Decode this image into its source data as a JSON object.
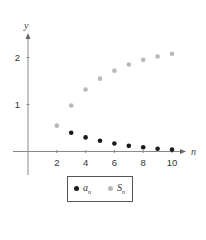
{
  "chart_data": {
    "type": "scatter",
    "title": "",
    "xlabel": "n",
    "ylabel": "y",
    "x_ticks": [
      2,
      4,
      6,
      8,
      10
    ],
    "y_ticks": [
      1,
      2
    ],
    "xlim": [
      -0.5,
      11
    ],
    "ylim": [
      -0.5,
      2.5
    ],
    "grid": false,
    "legend_position": "bottom-center",
    "series": [
      {
        "name": "a_n",
        "label_base": "a",
        "label_sub": "n",
        "color": "#1a1a1a",
        "x": [
          3,
          4,
          5,
          6,
          7,
          8,
          9,
          10
        ],
        "values": [
          0.4,
          0.3,
          0.23,
          0.17,
          0.12,
          0.09,
          0.06,
          0.04
        ]
      },
      {
        "name": "S_n",
        "label_base": "S",
        "label_sub": "n",
        "color": "#b8b8b8",
        "x": [
          2,
          3,
          4,
          5,
          6,
          7,
          8,
          9,
          10
        ],
        "values": [
          0.55,
          0.98,
          1.32,
          1.55,
          1.72,
          1.85,
          1.95,
          2.02,
          2.08
        ]
      }
    ]
  },
  "axes": {
    "x_label": "n",
    "y_label": "y",
    "x_tick_labels": [
      "2",
      "4",
      "6",
      "8",
      "10"
    ],
    "y_tick_labels": [
      "1",
      "2"
    ]
  },
  "legend": {
    "items": [
      {
        "base": "a",
        "sub": "n",
        "color": "#1a1a1a"
      },
      {
        "base": "S",
        "sub": "n",
        "color": "#b8b8b8"
      }
    ]
  }
}
